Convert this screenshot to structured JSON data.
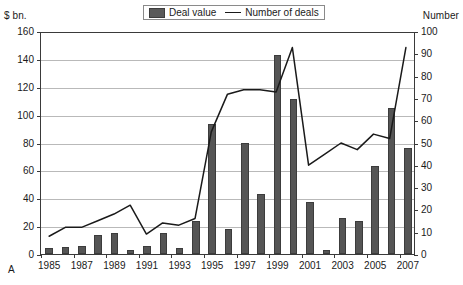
{
  "figure": {
    "label": "A",
    "y_left_title": "$ bn.",
    "y_right_title": "Number"
  },
  "legend": {
    "position": "top-center",
    "items": [
      {
        "name": "deal-value",
        "label": "Deal value",
        "marker": "bar-swatch",
        "color": "#555555"
      },
      {
        "name": "number-of-deals",
        "label": "Number of deals",
        "marker": "line-swatch",
        "color": "#1a1a1a"
      }
    ]
  },
  "chart_data": {
    "type": "bar",
    "title": "",
    "subtitle": "",
    "xlabel": "",
    "ylabel": "$ bn.",
    "y2label": "Number",
    "grid": true,
    "legend_position": "top-center",
    "ylim": [
      0,
      160
    ],
    "y2lim": [
      0,
      100
    ],
    "yticks": [
      0,
      20,
      40,
      60,
      80,
      100,
      120,
      140,
      160
    ],
    "y2ticks": [
      0,
      10,
      20,
      30,
      40,
      50,
      60,
      70,
      80,
      90,
      100
    ],
    "categories": [
      "1985",
      "1986",
      "1987",
      "1988",
      "1989",
      "1990",
      "1991",
      "1992",
      "1993",
      "1994",
      "1995",
      "1996",
      "1997",
      "1998",
      "1999",
      "2000",
      "2001",
      "2002",
      "2003",
      "2004",
      "2005",
      "2006",
      "2007"
    ],
    "xtick_labels": [
      "1985",
      "1987",
      "1989",
      "1991",
      "1993",
      "1995",
      "1997",
      "1999",
      "2001",
      "2003",
      "2005",
      "2007"
    ],
    "series": [
      {
        "name": "Deal value",
        "type": "bar",
        "axis": "left",
        "unit": "$ bn.",
        "color": "#555555",
        "values": [
          4,
          5,
          6,
          14,
          15,
          3,
          6,
          15,
          4,
          24,
          93,
          18,
          80,
          43,
          143,
          111,
          37,
          3,
          26,
          24,
          63,
          105,
          76
        ]
      },
      {
        "name": "Number of deals",
        "type": "line",
        "axis": "right",
        "unit": "Number",
        "color": "#1a1a1a",
        "values": [
          8,
          12,
          12,
          15,
          18,
          22,
          9,
          14,
          13,
          16,
          55,
          72,
          74,
          74,
          73,
          93,
          40,
          45,
          50,
          47,
          54,
          52,
          93
        ]
      }
    ]
  }
}
